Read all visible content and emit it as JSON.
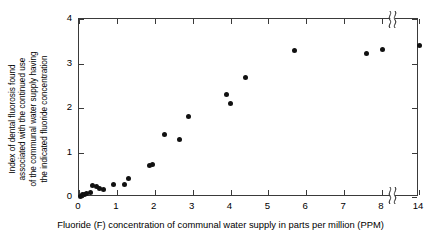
{
  "chart_data": {
    "type": "scatter",
    "title": "",
    "xlabel": "Fluoride (F) concentration of communal water supply in parts per million (PPM)",
    "ylabel": "Index of dental fluorosis found associated with the continued use of the communal water supply having the indicated fluoride concentration",
    "ylabel_lines": [
      "Index of dental fluorosis found",
      "associated with the continued use",
      "of the communal water supply having",
      "the indicated fluoride concentration"
    ],
    "xlim": [
      0,
      14
    ],
    "ylim": [
      0,
      4
    ],
    "grid": false,
    "legend": null,
    "axis_break": {
      "after": 8,
      "before": 14,
      "style": "double-squiggle"
    },
    "xticks": [
      0,
      1,
      2,
      3,
      4,
      5,
      6,
      7,
      8,
      14
    ],
    "xticklabels": [
      "0",
      "1",
      "2",
      "3",
      "4",
      "5",
      "6",
      "7",
      "8",
      "14"
    ],
    "yticks": [
      0,
      1,
      2,
      3,
      4
    ],
    "yticklabels": [
      "0",
      "1",
      "2",
      "3",
      "4"
    ],
    "marker": "filled-circle",
    "marker_color": "#111111",
    "points": [
      {
        "x": 0.05,
        "y": 0.02
      },
      {
        "x": 0.1,
        "y": 0.05
      },
      {
        "x": 0.15,
        "y": 0.05
      },
      {
        "x": 0.2,
        "y": 0.08
      },
      {
        "x": 0.3,
        "y": 0.1
      },
      {
        "x": 0.35,
        "y": 0.25
      },
      {
        "x": 0.45,
        "y": 0.23
      },
      {
        "x": 0.55,
        "y": 0.2
      },
      {
        "x": 0.65,
        "y": 0.17
      },
      {
        "x": 0.9,
        "y": 0.28
      },
      {
        "x": 1.2,
        "y": 0.29
      },
      {
        "x": 1.3,
        "y": 0.42
      },
      {
        "x": 1.85,
        "y": 0.7
      },
      {
        "x": 1.95,
        "y": 0.72
      },
      {
        "x": 2.25,
        "y": 1.4
      },
      {
        "x": 2.65,
        "y": 1.3
      },
      {
        "x": 2.9,
        "y": 1.8
      },
      {
        "x": 3.9,
        "y": 2.3
      },
      {
        "x": 4.0,
        "y": 2.1
      },
      {
        "x": 4.4,
        "y": 2.68
      },
      {
        "x": 5.7,
        "y": 3.3
      },
      {
        "x": 7.6,
        "y": 3.22
      },
      {
        "x": 8.1,
        "y": 3.32
      },
      {
        "x": 14.1,
        "y": 3.4
      }
    ]
  },
  "axes": {
    "frame_color": "#3a3a3a",
    "background": "#ffffff"
  }
}
